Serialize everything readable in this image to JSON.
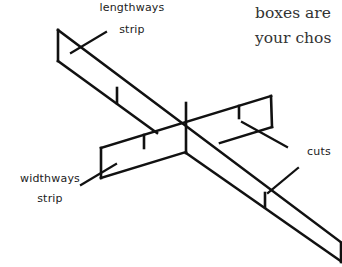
{
  "body_text": {
    "lines": [
      "boxes are",
      "your chos"
    ]
  },
  "labels": {
    "lengthways": [
      "lengthways",
      "strip"
    ],
    "widthways": [
      "widthways",
      "strip"
    ],
    "cuts": "cuts"
  },
  "colors": {
    "line": "#111111",
    "text": "#222222",
    "background": "#ffffff"
  }
}
